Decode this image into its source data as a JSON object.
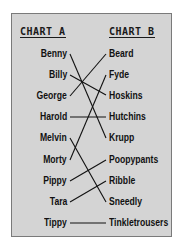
{
  "chart_a": {
    "title": "CHART A",
    "names": [
      "Benny",
      "Billy",
      "George",
      "Harold",
      "Melvin",
      "Morty",
      "Pippy",
      "Tara",
      "Tippy"
    ]
  },
  "chart_b": {
    "title": "CHART B",
    "names": [
      "Beard",
      "Fyde",
      "Hoskins",
      "Hutchins",
      "Krupp",
      "Poopypants",
      "Ribble",
      "Sneedly",
      "Tinkletrousers"
    ]
  },
  "connections": [
    {
      "from": "Benny",
      "to": "Krupp"
    },
    {
      "from": "Billy",
      "to": "Hoskins"
    },
    {
      "from": "George",
      "to": "Beard"
    },
    {
      "from": "Harold",
      "to": "Hutchins"
    },
    {
      "from": "Melvin",
      "to": "Sneedly"
    },
    {
      "from": "Morty",
      "to": "Fyde"
    },
    {
      "from": "Pippy",
      "to": "Poopypants"
    },
    {
      "from": "Tara",
      "to": "Ribble"
    },
    {
      "from": "Tippy",
      "to": "Tinkletrousers"
    }
  ],
  "colors": {
    "panel_bg": "#d4d4d4",
    "border": "#7a7a7a",
    "text": "#111111"
  }
}
